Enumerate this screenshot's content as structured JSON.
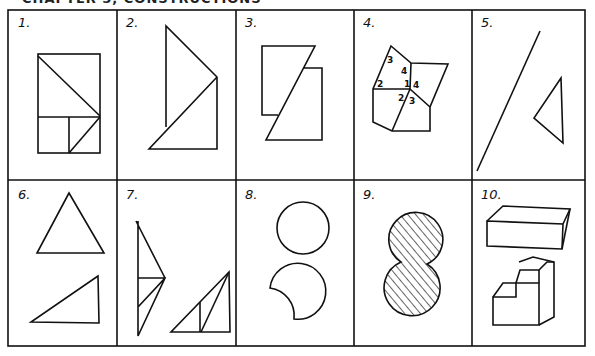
{
  "header": {
    "title": "CHAPTER 5, CONSTRUCTIONS"
  },
  "grid": {
    "rows": 2,
    "columns": 5,
    "line_color": "#111111",
    "background": "#ffffff"
  },
  "panels": [
    {
      "label": "1.",
      "description": "rectangle divided by diagonal with square and triangle"
    },
    {
      "label": "2.",
      "description": "two overlapping right triangles"
    },
    {
      "label": "3.",
      "description": "two rectangles cut by slanted line"
    },
    {
      "label": "4.",
      "description": "polygon divided into pieces with numbered angles",
      "numbers": [
        "3",
        "4",
        "2",
        "1",
        "4",
        "2",
        "3"
      ]
    },
    {
      "label": "5.",
      "description": "line segment and triangle"
    },
    {
      "label": "6.",
      "description": "equilateral triangle and right triangle"
    },
    {
      "label": "7.",
      "description": "dissected triangles"
    },
    {
      "label": "8.",
      "description": "circle and crescent shape"
    },
    {
      "label": "9.",
      "description": "hatched figure-eight shape"
    },
    {
      "label": "10.",
      "description": "rectangular prism and stepped block"
    }
  ]
}
